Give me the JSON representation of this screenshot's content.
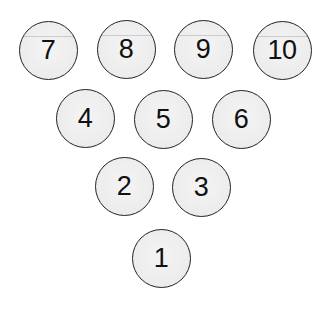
{
  "diagram": {
    "title": "",
    "colors": {
      "fill": "#ededed",
      "stroke": "#222222",
      "text": "#111111",
      "background": "#ffffff"
    },
    "pins": [
      {
        "label": "7",
        "cx": 48,
        "cy": 50
      },
      {
        "label": "8",
        "cx": 126,
        "cy": 49
      },
      {
        "label": "9",
        "cx": 203,
        "cy": 49
      },
      {
        "label": "10",
        "cx": 282,
        "cy": 50
      },
      {
        "label": "4",
        "cx": 85,
        "cy": 118
      },
      {
        "label": "5",
        "cx": 163,
        "cy": 119
      },
      {
        "label": "6",
        "cx": 241,
        "cy": 119
      },
      {
        "label": "2",
        "cx": 124,
        "cy": 186
      },
      {
        "label": "3",
        "cx": 201,
        "cy": 187
      },
      {
        "label": "1",
        "cx": 161,
        "cy": 258
      }
    ]
  }
}
